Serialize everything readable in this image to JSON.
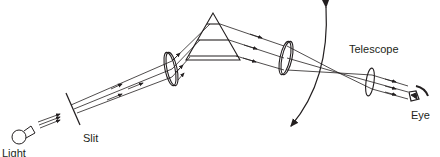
{
  "diagram": {
    "type": "prism spectrometer schematic",
    "labels": {
      "light_source_line1": "Light",
      "light_source_line2": "source",
      "slit": "Slit",
      "telescope": "Telescope",
      "eye": "Eye"
    },
    "components": [
      "light source",
      "slit",
      "collimating lens",
      "prism",
      "telescope objective lens",
      "eyepiece lens",
      "eye"
    ],
    "colors": {
      "stroke": "#231f20",
      "background": "#ffffff"
    }
  }
}
